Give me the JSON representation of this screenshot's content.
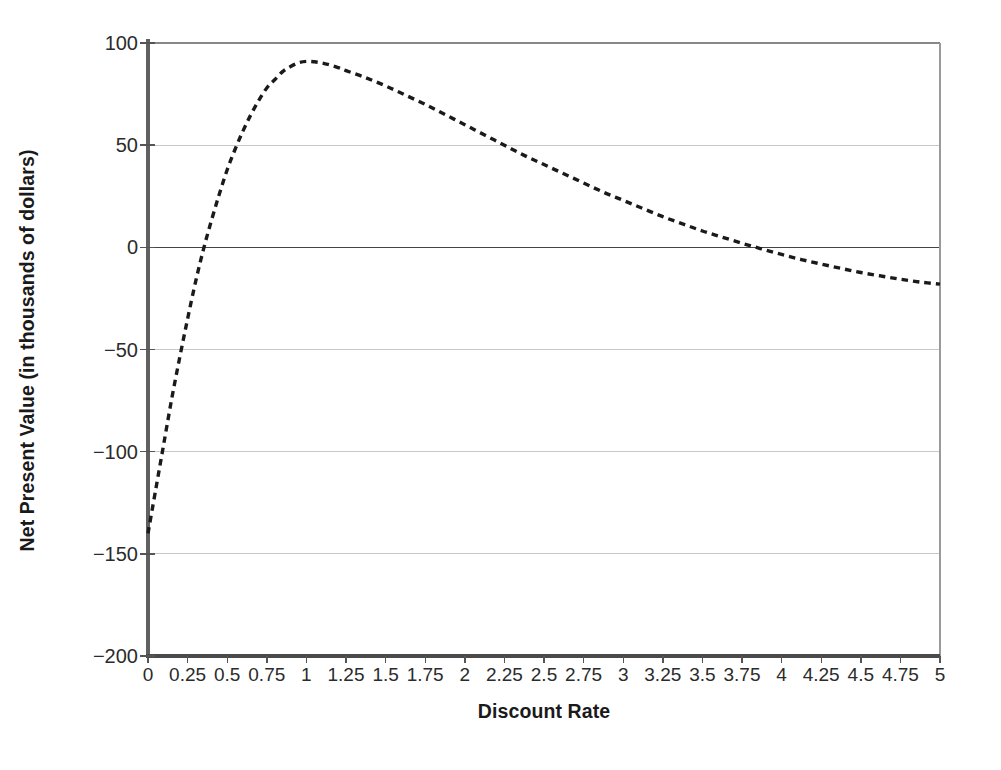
{
  "chart_data": {
    "type": "line",
    "title": "",
    "xlabel": "Discount Rate",
    "ylabel": "Net Present Value (in thousands of dollars)",
    "xlim": [
      0,
      5
    ],
    "ylim": [
      -200,
      100
    ],
    "grid": true,
    "legend": false,
    "line_style": "dashed",
    "line_color": "#1a1a1a",
    "grid_color": "#c8c8c8",
    "axis_color": "#555555",
    "zero_line_color": "#444444",
    "xticks": [
      "0",
      "0.25",
      "0.5",
      "0.75",
      "1",
      "1.25",
      "1.5",
      "1.75",
      "2",
      "2.25",
      "2.5",
      "2.75",
      "3",
      "3.25",
      "3.5",
      "3.75",
      "4",
      "4.25",
      "4.5",
      "4.75",
      "5"
    ],
    "xtick_values": [
      0,
      0.25,
      0.5,
      0.75,
      1,
      1.25,
      1.5,
      1.75,
      2,
      2.25,
      2.5,
      2.75,
      3,
      3.25,
      3.5,
      3.75,
      4,
      4.25,
      4.5,
      4.75,
      5
    ],
    "yticks": [
      "100",
      "50",
      "0",
      "−50",
      "−100",
      "−150",
      "−200"
    ],
    "ytick_values": [
      100,
      50,
      0,
      -50,
      -100,
      -150,
      -200
    ],
    "gridline_values": [
      50,
      -50,
      -100,
      -150
    ],
    "series": [
      {
        "name": "Net Present Value",
        "x": [
          0,
          0.05,
          0.1,
          0.15,
          0.2,
          0.25,
          0.3,
          0.35,
          0.4,
          0.45,
          0.5,
          0.55,
          0.6,
          0.65,
          0.7,
          0.75,
          0.8,
          0.85,
          0.9,
          0.95,
          1,
          1.05,
          1.1,
          1.15,
          1.2,
          1.25,
          1.375,
          1.5,
          1.625,
          1.75,
          1.875,
          2,
          2.125,
          2.25,
          2.375,
          2.5,
          2.625,
          2.75,
          2.875,
          3,
          3.125,
          3.25,
          3.375,
          3.5,
          3.625,
          3.75,
          3.875,
          4,
          4.125,
          4.25,
          4.375,
          4.5,
          4.625,
          4.75,
          4.875,
          5
        ],
        "y": [
          -140,
          -118,
          -96,
          -74,
          -54,
          -35,
          -17,
          -1,
          13,
          26,
          38,
          48,
          57,
          65,
          72,
          78,
          82,
          86,
          88.5,
          90.3,
          91,
          90.8,
          90.2,
          89.2,
          88,
          86.5,
          83,
          79,
          74.5,
          70,
          65,
          60,
          55,
          50,
          45,
          40.5,
          36,
          31.5,
          27,
          23,
          19,
          15,
          11.5,
          8,
          5,
          2,
          -0.8,
          -3.5,
          -6,
          -8.2,
          -10.3,
          -12.3,
          -14,
          -15.6,
          -17,
          -18
        ]
      }
    ],
    "annotations": []
  }
}
